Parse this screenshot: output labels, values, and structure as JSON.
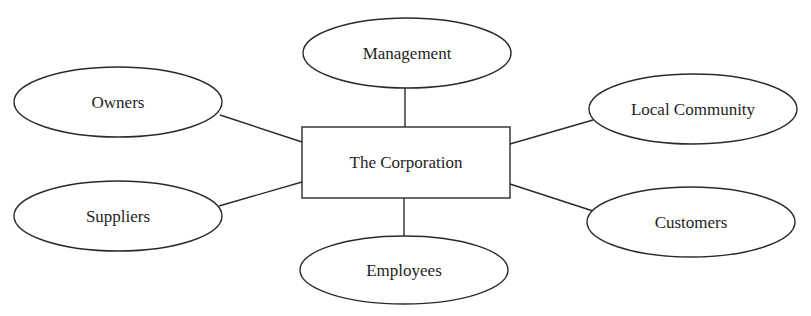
{
  "diagram": {
    "type": "stakeholder-hub",
    "center": {
      "label": "The Corporation",
      "shape": "rectangle",
      "x": 302,
      "y": 127,
      "w": 208,
      "h": 71
    },
    "nodes": [
      {
        "id": "management",
        "label": "Management",
        "cx": 407,
        "cy": 53,
        "rx": 104,
        "ry": 35
      },
      {
        "id": "owners",
        "label": "Owners",
        "cx": 118,
        "cy": 102,
        "rx": 104,
        "ry": 35
      },
      {
        "id": "local-community",
        "label": "Local Community",
        "cx": 693,
        "cy": 109,
        "rx": 104,
        "ry": 35
      },
      {
        "id": "suppliers",
        "label": "Suppliers",
        "cx": 118,
        "cy": 216,
        "rx": 104,
        "ry": 35
      },
      {
        "id": "customers",
        "label": "Customers",
        "cx": 691,
        "cy": 222,
        "rx": 104,
        "ry": 35
      },
      {
        "id": "employees",
        "label": "Employees",
        "cx": 404,
        "cy": 270,
        "rx": 104,
        "ry": 34
      }
    ],
    "edges": [
      {
        "to": "management",
        "x1": 405,
        "y1": 88,
        "x2": 405,
        "y2": 127
      },
      {
        "to": "owners",
        "x1": 220,
        "y1": 115,
        "x2": 302,
        "y2": 142
      },
      {
        "to": "local-community",
        "x1": 510,
        "y1": 144,
        "x2": 593,
        "y2": 120
      },
      {
        "to": "suppliers",
        "x1": 219,
        "y1": 206,
        "x2": 302,
        "y2": 182
      },
      {
        "to": "customers",
        "x1": 510,
        "y1": 184,
        "x2": 593,
        "y2": 211
      },
      {
        "to": "employees",
        "x1": 404,
        "y1": 198,
        "x2": 404,
        "y2": 236
      }
    ]
  }
}
